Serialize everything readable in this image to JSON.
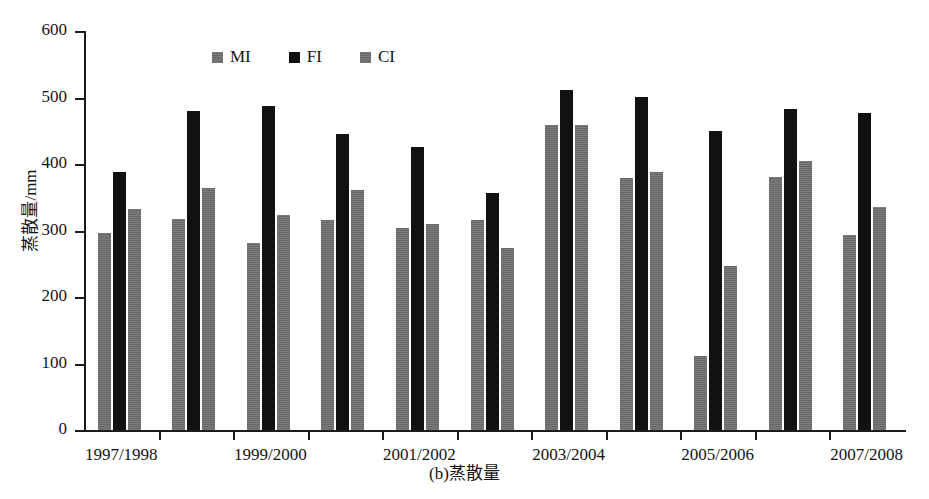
{
  "chart_data": {
    "type": "bar",
    "title": "",
    "caption": "(b)蒸散量",
    "xlabel": "",
    "ylabel": "蒸散量/mm",
    "ylim": [
      0,
      600
    ],
    "ytick_step": 100,
    "yticks": [
      "600",
      "500",
      "400",
      "300",
      "200",
      "100",
      "0"
    ],
    "grid": false,
    "legend_position": "top-left-inside",
    "categories": [
      "1997/1998",
      "1998/1999",
      "1999/2000",
      "2000/2001",
      "2001/2002",
      "2002/2003",
      "2003/2004",
      "2004/2005",
      "2005/2006",
      "2006/2007",
      "2007/2008"
    ],
    "visible_tick_labels": [
      "1997/1998",
      "1999/2000",
      "2001/2002",
      "2003/2004",
      "2005/2006",
      "2007/2008"
    ],
    "series": [
      {
        "name": "MI",
        "color": "#6e6e6e",
        "values": [
          297,
          317,
          281,
          316,
          304,
          316,
          459,
          379,
          112,
          380,
          293
        ]
      },
      {
        "name": "FI",
        "color": "#111111",
        "values": [
          388,
          479,
          487,
          445,
          425,
          357,
          511,
          501,
          450,
          483,
          477
        ]
      },
      {
        "name": "CI",
        "color": "#6e6e6e",
        "values": [
          332,
          364,
          324,
          361,
          310,
          273,
          459,
          388,
          246,
          405,
          336
        ]
      }
    ]
  },
  "legend": {
    "items": [
      {
        "label": "MI",
        "swatch": "gray"
      },
      {
        "label": "FI",
        "swatch": "black"
      },
      {
        "label": "CI",
        "swatch": "gray"
      }
    ]
  }
}
